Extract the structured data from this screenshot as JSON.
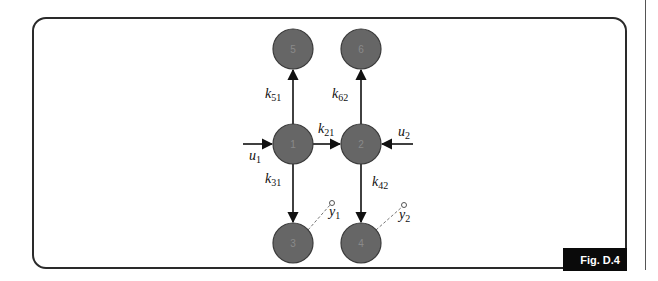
{
  "figure": {
    "caption_tag": "Fig. D.4",
    "type": "compartmental model diagram"
  },
  "colors": {
    "node_fill": "#666666",
    "node_stroke": "#3a3a3a",
    "edge": "#111111",
    "frame": "#2a2a2a",
    "tag_bg": "#0a0a0a",
    "tag_text": "#ffffff"
  },
  "nodes": [
    {
      "id": "1",
      "label": "1",
      "x": 293,
      "y": 144
    },
    {
      "id": "2",
      "label": "2",
      "x": 361,
      "y": 144
    },
    {
      "id": "3",
      "label": "3",
      "x": 293,
      "y": 243
    },
    {
      "id": "4",
      "label": "4",
      "x": 361,
      "y": 243
    },
    {
      "id": "5",
      "label": "5",
      "x": 293,
      "y": 49
    },
    {
      "id": "6",
      "label": "6",
      "x": 361,
      "y": 49
    }
  ],
  "edges": [
    {
      "from": "1",
      "to": "5",
      "label_base": "k",
      "label_sub": "51"
    },
    {
      "from": "2",
      "to": "6",
      "label_base": "k",
      "label_sub": "62"
    },
    {
      "from": "1",
      "to": "2",
      "label_base": "k",
      "label_sub": "21"
    },
    {
      "from": "1",
      "to": "3",
      "label_base": "k",
      "label_sub": "31"
    },
    {
      "from": "2",
      "to": "4",
      "label_base": "k",
      "label_sub": "42"
    }
  ],
  "inputs": [
    {
      "to": "1",
      "label_base": "u",
      "label_sub": "1"
    },
    {
      "to": "2",
      "label_base": "u",
      "label_sub": "2"
    }
  ],
  "outputs": [
    {
      "from": "3",
      "label_base": "y",
      "label_sub": "1"
    },
    {
      "from": "4",
      "label_base": "y",
      "label_sub": "2"
    }
  ]
}
